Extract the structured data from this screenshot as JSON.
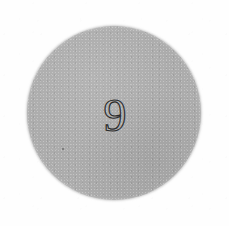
{
  "image": {
    "kind": "scanned-photo",
    "width": 229,
    "height": 226,
    "background_color": "#fefefe",
    "alt_text": "Gray circular disc with a handwritten numeral"
  },
  "disc": {
    "shape": "circle",
    "fill_color": "#acacac",
    "center_x": 114,
    "center_y": 113,
    "radius": 87,
    "texture": "speckled-grain",
    "edge": "soft-antialiased"
  },
  "marking": {
    "label": "9",
    "value": 9,
    "style": "outline-stroke",
    "stroke_color": "#2b2b2b",
    "center_x": 115,
    "center_y": 114,
    "height_px": 34
  },
  "artifacts": {
    "speck_label": "",
    "speck_color": "#3c3c3c"
  }
}
